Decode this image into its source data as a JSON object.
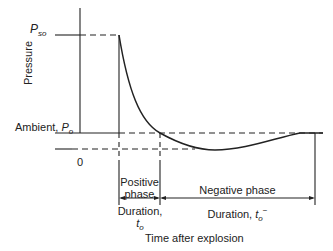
{
  "diagram": {
    "y_axis_label": "Pressure",
    "x_axis_label": "Time after explosion",
    "peak_label": {
      "symbol": "P",
      "subscript": "so"
    },
    "ambient_label": {
      "text": "Ambient, ",
      "symbol": "P",
      "subscript": "o"
    },
    "zero_label": "0",
    "positive_phase": {
      "line1": "Positive",
      "line2": "phase",
      "duration_label": "Duration,",
      "symbol": "t",
      "subscript": "o"
    },
    "negative_phase": {
      "label": "Negative phase",
      "duration_label": "Duration, ",
      "symbol": "t",
      "subscript": "o",
      "superscript": "−"
    }
  }
}
